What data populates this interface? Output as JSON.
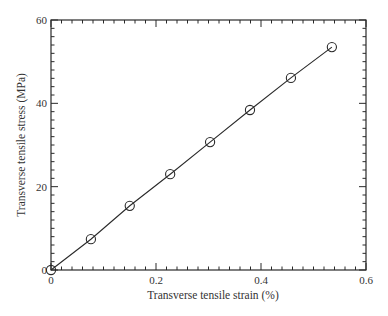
{
  "chart_data": {
    "type": "line",
    "title": "",
    "xlabel": "Transverse tensile strain (%)",
    "ylabel": "Transverse tensile stress (MPa)",
    "xlim": [
      0,
      0.6
    ],
    "ylim": [
      0,
      60
    ],
    "x_ticks": [
      0,
      0.2,
      0.4,
      0.6
    ],
    "x_tick_labels": [
      "0",
      "0.2",
      "0.4",
      "0.6"
    ],
    "x_minor_step": 0.02,
    "y_ticks": [
      0,
      20,
      40,
      60
    ],
    "y_tick_labels": [
      "0",
      "20",
      "40",
      "60"
    ],
    "y_minor_step": 2,
    "grid": false,
    "legend": null,
    "series": [
      {
        "name": "Transverse tensile test",
        "marker": "open-circle",
        "line": "solid",
        "x": [
          0,
          0.076,
          0.15,
          0.227,
          0.303,
          0.379,
          0.457,
          0.535
        ],
        "y": [
          0,
          7.4,
          15.4,
          23.0,
          30.7,
          38.4,
          46.1,
          53.5
        ]
      }
    ]
  },
  "style": {
    "line_color": "#2a2a2a",
    "axis_color": "#2a2a2a",
    "text_color": "#333333"
  }
}
